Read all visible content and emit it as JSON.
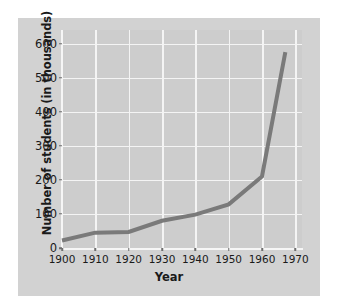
{
  "chart_data": {
    "type": "line",
    "title": "",
    "xlabel": "Year",
    "ylabel": "Number of students (in thousands)",
    "xlim": [
      1900,
      1972
    ],
    "ylim": [
      0,
      640
    ],
    "xticks": [
      1900,
      1910,
      1920,
      1930,
      1940,
      1950,
      1960,
      1970
    ],
    "xtick_labels": [
      "1900",
      "1910",
      "1920",
      "1930",
      "1940",
      "1950",
      "1960",
      "1970"
    ],
    "yticks": [
      0,
      100,
      200,
      300,
      400,
      500,
      600
    ],
    "ytick_labels": [
      "0",
      "100",
      "200",
      "300",
      "400",
      "500",
      "600"
    ],
    "grid": true,
    "grid_color": "#f4f4f4",
    "legend": false,
    "series": [
      {
        "name": "Number of students",
        "color": "#7a7a7a",
        "line_width": 4,
        "markers": false,
        "x": [
          1900,
          1910,
          1920,
          1930,
          1940,
          1950,
          1960,
          1967
        ],
        "values": [
          22,
          45,
          47,
          80,
          98,
          128,
          210,
          575
        ]
      }
    ],
    "figure_background": "#d2d2d2",
    "plot_background": "#cdcdcd"
  }
}
